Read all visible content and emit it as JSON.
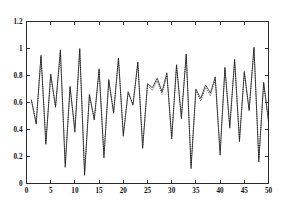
{
  "figure": {
    "background_color": "#ffffff",
    "axis_color": "#2b2b2b"
  },
  "chart_data": {
    "type": "line",
    "title": "",
    "subtitle": "",
    "xlabel": "",
    "ylabel": "",
    "xlim": [
      0,
      50
    ],
    "ylim": [
      0,
      1.2
    ],
    "grid": false,
    "legend": null,
    "legend_position": "none",
    "xticks": [
      0,
      5,
      10,
      15,
      20,
      25,
      30,
      35,
      40,
      45,
      50
    ],
    "xtick_labels": [
      "0",
      "5",
      "10",
      "15",
      "20",
      "25",
      "30",
      "35",
      "40",
      "45",
      "50"
    ],
    "yticks": [
      0,
      0.2,
      0.4,
      0.6,
      0.8,
      1,
      1.2
    ],
    "ytick_labels": [
      "0",
      "0.2",
      "0.4",
      "0.6",
      "0.8",
      "1",
      "1.2"
    ],
    "x": [
      1,
      2,
      3,
      4,
      5,
      6,
      7,
      8,
      9,
      10,
      11,
      12,
      13,
      14,
      15,
      16,
      17,
      18,
      19,
      20,
      21,
      22,
      23,
      24,
      25,
      26,
      27,
      28,
      29,
      30,
      31,
      32,
      33,
      34,
      35,
      36,
      37,
      38,
      39,
      40,
      41,
      42,
      43,
      44,
      45,
      46,
      47,
      48,
      49,
      50
    ],
    "series": [
      {
        "name": "series-solid",
        "style": "solid",
        "color": "#161616",
        "values": [
          0.62,
          0.44,
          0.95,
          0.29,
          0.81,
          0.57,
          0.99,
          0.12,
          0.72,
          0.38,
          1.0,
          0.06,
          0.66,
          0.47,
          0.85,
          0.19,
          0.77,
          0.52,
          0.93,
          0.35,
          0.68,
          0.58,
          0.9,
          0.26,
          0.74,
          0.71,
          0.78,
          0.68,
          0.82,
          0.33,
          0.88,
          0.48,
          0.96,
          0.11,
          0.7,
          0.63,
          0.73,
          0.67,
          0.79,
          0.21,
          0.86,
          0.41,
          0.92,
          0.31,
          0.83,
          0.54,
          1.01,
          0.16,
          0.75,
          0.46
        ]
      },
      {
        "name": "series-dotted",
        "style": "dotted",
        "color": "#1a1a1a",
        "values": [
          0.62,
          0.45,
          0.94,
          0.31,
          0.8,
          0.56,
          0.97,
          0.15,
          0.71,
          0.41,
          0.99,
          0.09,
          0.65,
          0.48,
          0.84,
          0.22,
          0.76,
          0.53,
          0.92,
          0.37,
          0.67,
          0.59,
          0.89,
          0.28,
          0.73,
          0.69,
          0.76,
          0.66,
          0.8,
          0.35,
          0.87,
          0.5,
          0.95,
          0.14,
          0.69,
          0.61,
          0.71,
          0.65,
          0.77,
          0.24,
          0.85,
          0.43,
          0.91,
          0.33,
          0.82,
          0.55,
          1.0,
          0.19,
          0.74,
          0.47
        ]
      }
    ]
  }
}
